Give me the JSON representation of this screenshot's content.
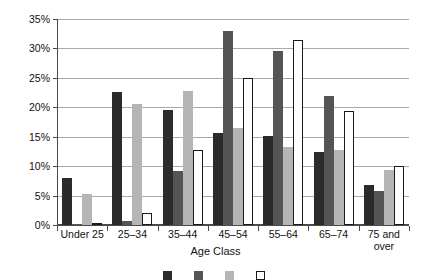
{
  "chart_data": {
    "type": "bar",
    "title": "",
    "xlabel": "Age Class",
    "ylabel": "",
    "ylim": [
      0,
      35
    ],
    "ytick_labels": [
      "0%",
      "5%",
      "10%",
      "15%",
      "20%",
      "25%",
      "30%",
      "35%"
    ],
    "ytick_values": [
      0,
      5,
      10,
      15,
      20,
      25,
      30,
      35
    ],
    "grid": true,
    "legend_position": "bottom",
    "categories": [
      "Under 25",
      "25–34",
      "35–44",
      "45–54",
      "55–64",
      "65–74",
      "75 and\nover"
    ],
    "series": [
      {
        "name": "Series 1",
        "color": "#2b2b2b",
        "values": [
          8.0,
          22.6,
          19.6,
          15.7,
          15.1,
          12.4,
          6.8
        ]
      },
      {
        "name": "Series 2",
        "color": "#555555",
        "values": [
          0.1,
          0.7,
          9.2,
          32.9,
          29.5,
          22.0,
          5.8
        ]
      },
      {
        "name": "Series 3",
        "color": "#b5b5b5",
        "values": [
          5.3,
          20.5,
          22.7,
          16.5,
          13.3,
          12.7,
          9.4
        ]
      },
      {
        "name": "Series 4",
        "color": "#ffffff",
        "values": [
          0.2,
          2.0,
          12.8,
          25.0,
          31.4,
          19.3,
          10.0
        ]
      }
    ]
  },
  "legend": {
    "items": [
      {
        "label": "",
        "color": "#2b2b2b"
      },
      {
        "label": "",
        "color": "#555555"
      },
      {
        "label": "",
        "color": "#b5b5b5"
      },
      {
        "label": "",
        "color": "#ffffff"
      }
    ]
  }
}
